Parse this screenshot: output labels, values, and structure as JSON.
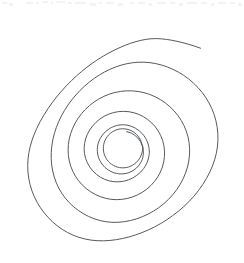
{
  "canvas": {
    "width": 244,
    "height": 263,
    "background_color": "#ffffff",
    "title": "Spiral Drawing"
  },
  "drawing": {
    "name": "hand-drawn-spiral",
    "description": "Freehand spiral, about three and a half turns, drawn clockwise inward",
    "stroke_color": "#555a5e",
    "stroke_width": 1,
    "fill": "none",
    "turns": 3.5,
    "winding": "inward-clockwise",
    "outer_end_point": {
      "x": 200,
      "y": 48
    },
    "inner_end_point": {
      "x": 130,
      "y": 143
    },
    "bounds": {
      "left": 17,
      "top": 38,
      "right": 222,
      "bottom": 241
    },
    "center": {
      "x": 124,
      "y": 146
    },
    "path": "M200.5,48.2 C193,45.4 185,43.1 177,41.3 C170,39.8 163,38.7 156.2,38.6 C149,38.5 142.4,39.8 136,41.6 C128.6,43.7 121.6,46.6 114.8,49.9 C107,53.7 99.6,58.1 92.5,63.1 C85,68.4 78,74.3 71.4,80.7 C64.4,87.5 57.9,94.9 52.1,102.8 C46.2,110.8 41,119.3 36.8,128.3 C33.2,136 30.4,144.1 28.9,152.5 C27.4,161 27.3,169.7 28.7,178.2 C30.1,186.7 33,194.9 37.2,202.4 C41.2,209.6 46.4,216.2 52.5,221.8 C58.6,227.4 65.6,232 73.2,235.2 C80.7,238.4 88.8,240.2 97,240.7 C105.6,241.2 114.2,240.3 122.6,238.5 C131.4,236.6 140,233.7 148.2,230 C156.8,226.1 165,221.3 172.6,215.7 C180.4,210 187.6,203.5 193.9,196.2 C200.2,188.9 205.6,180.8 209.8,172.1 C213.6,164.2 216.3,155.7 217.4,147 C218.5,138.2 218,129.3 215.9,120.7 C213.9,112.4 210.4,104.5 205.7,97.4 C201.1,90.4 195.3,84.2 188.7,79 C182.2,73.9 174.9,69.8 167.2,66.9 C159.8,64.1 152,62.5 144.1,62.2 C136.3,61.9 128.5,63 121,65.2 C113.4,67.4 106.2,70.7 99.5,74.9 C92.5,79.2 86,84.4 80.2,90.3 C74.2,96.4 68.9,103.1 64.5,110.4 C60.1,117.7 56.6,125.6 54.3,133.8 C52,141.9 50.9,150.4 51.2,158.8 C51.5,167 53.2,175.2 56.3,182.8 C59.3,190.1 63.7,196.9 69.2,202.6 C74.7,208.3 81.3,213 88.5,216.4 C95.8,219.9 103.8,221.9 111.9,222.3 C120.2,222.7 128.5,221.4 136.4,218.9 C144.4,216.3 152,212.5 158.8,207.6 C165.7,202.6 171.8,196.6 176.7,189.7 C181.6,182.8 185.3,175.1 187.5,167 C189.6,159.1 190.2,150.8 189.1,142.7 C188,134.8 185.3,127.2 181.2,120.4 C177.1,113.6 171.7,107.7 165.3,102.9 C158.9,98.1 151.6,94.6 143.9,92.6 C136.3,90.7 128.3,90.3 120.6,91.4 C112.9,92.5 105.5,95.1 98.8,99 C92.2,102.8 86.3,107.8 81.5,113.7 C76.7,119.6 73,126.3 70.7,133.5 C68.4,140.6 67.6,148.2 68.4,155.6 C69.2,162.9 71.6,170 75.4,176.2 C79.2,182.4 84.4,187.7 90.5,191.7 C96.6,195.7 103.6,198.4 110.8,199.3 C118.1,200.2 125.5,199.4 132.4,197 C139.3,194.6 145.7,190.7 150.9,185.5 C156.1,180.3 160.1,173.9 162.4,167 C164.6,160.2 165.2,152.8 163.9,145.7 C162.7,138.8 159.7,132.2 155.3,126.8 C150.9,121.4 145.2,117.1 138.8,114.4 C132.5,111.8 125.5,110.8 118.7,111.6 C111.9,112.4 105.4,115 99.9,119 C94.5,123 90.1,128.3 87.3,134.4 C84.6,140.4 83.5,147.1 84.5,153.6 C85.5,160 88.4,166.1 92.8,170.9 C97.2,175.8 103,179.3 109.3,180.9 C115.6,182.5 122.3,182.1 128.4,179.9 C134.4,177.7 139.8,173.8 143.6,168.6 C147.4,163.5 149.5,157.2 149.3,150.9 C149.1,144.7 146.6,138.6 142.5,133.9 C138.4,129.3 132.8,126.1 126.8,125.1 C120.8,124.1 114.5,125.4 109.3,128.7 C104.1,132 100.1,137.1 98.3,142.9 C96.6,148.6 97.1,155 99.7,160.3 C102.3,165.6 106.8,169.9 112.2,172.1 C117.6,174.4 123.8,174.5 129.2,172.5 C134.6,170.5 139.1,166.4 141.5,161.2 C143.8,156.2 144,150.3 142.1,145.1 C140.2,139.9 136.3,135.5 131.4,133.2 C129.9,132.5 128.3,132 126.7,131.7",
    "inner_hook_path": "M142.8,146.4 C143.0,152.4 140.6,158.4 136.2,162.5 C131.8,166.7 125.5,168.6 119.6,167.6 C113.7,166.6 108.4,162.8 105.6,157.5 C102.8,152.2 102.6,145.6 105.1,140.2 C107.5,134.8 112.5,130.7 118.3,129.3 C124.0,127.9 130.3,129.3 134.9,133.0 C139.4,136.6 142.2,142.1 142.6,147.9"
  },
  "top_artifacts": {
    "name": "cropped-ui-strip-artifacts",
    "color": "#f3f3f5",
    "marks": [
      {
        "x": 2,
        "y": 2,
        "w": 5
      },
      {
        "x": 9,
        "y": 3,
        "w": 4
      },
      {
        "x": 26,
        "y": 2,
        "w": 7
      },
      {
        "x": 36,
        "y": 2,
        "w": 3
      },
      {
        "x": 42,
        "y": 1,
        "w": 6
      },
      {
        "x": 51,
        "y": 2,
        "w": 2
      },
      {
        "x": 56,
        "y": 1,
        "w": 9
      },
      {
        "x": 68,
        "y": 2,
        "w": 4
      },
      {
        "x": 75,
        "y": 2,
        "w": 11
      },
      {
        "x": 90,
        "y": 3,
        "w": 6
      },
      {
        "x": 99,
        "y": 2,
        "w": 3
      },
      {
        "x": 106,
        "y": 2,
        "w": 8
      },
      {
        "x": 118,
        "y": 3,
        "w": 5
      },
      {
        "x": 130,
        "y": 2,
        "w": 4
      },
      {
        "x": 138,
        "y": 2,
        "w": 7
      },
      {
        "x": 149,
        "y": 3,
        "w": 3
      },
      {
        "x": 157,
        "y": 2,
        "w": 9
      },
      {
        "x": 170,
        "y": 2,
        "w": 5
      },
      {
        "x": 179,
        "y": 3,
        "w": 4
      },
      {
        "x": 187,
        "y": 2,
        "w": 10
      },
      {
        "x": 201,
        "y": 2,
        "w": 6
      },
      {
        "x": 211,
        "y": 3,
        "w": 3
      },
      {
        "x": 218,
        "y": 2,
        "w": 8
      },
      {
        "x": 230,
        "y": 2,
        "w": 5
      },
      {
        "x": 238,
        "y": 3,
        "w": 4
      }
    ]
  }
}
